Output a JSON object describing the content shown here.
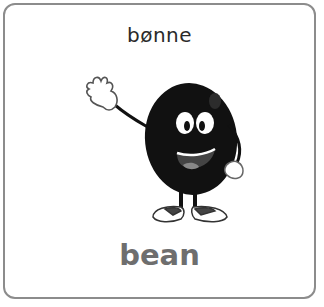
{
  "card": {
    "word_native": "bønne",
    "word_english": "bean",
    "illustration": "waving-bean-character",
    "colors": {
      "border": "#8c8c8c",
      "native_text": "#2a2a2a",
      "english_text": "#6e6e6e",
      "bean_body": "#111111"
    }
  }
}
